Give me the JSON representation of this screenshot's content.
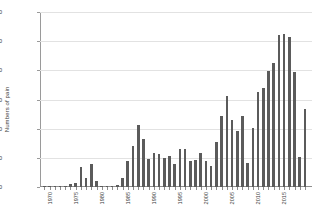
{
  "chart_data": {
    "type": "bar",
    "title": "",
    "xlabel": "",
    "ylabel": "Numbers of pain",
    "ylim": [
      0,
      3000
    ],
    "ytick_values": [
      0,
      500,
      1000,
      1500,
      2000,
      2500,
      3000
    ],
    "ytick_labels": [
      "0",
      "500",
      "1000",
      "1500",
      "2000",
      "2500",
      "3000"
    ],
    "xtick_labels": [
      "1970",
      "1975",
      "1980",
      "1985",
      "1990",
      "1995",
      "2000",
      "2005",
      "2010",
      "2015"
    ],
    "xlim": [
      1970,
      2018
    ],
    "grid": "horizontal",
    "legend": "none",
    "bar_color": "#5b5b5b",
    "categories": [
      "1970",
      "1971",
      "1972",
      "1973",
      "1974",
      "1975",
      "1976",
      "1977",
      "1978",
      "1979",
      "1980",
      "1981",
      "1982",
      "1983",
      "1984",
      "1985",
      "1986",
      "1987",
      "1988",
      "1989",
      "1990",
      "1991",
      "1992",
      "1993",
      "1994",
      "1995",
      "1996",
      "1997",
      "1998",
      "1999",
      "2000",
      "2001",
      "2002",
      "2003",
      "2004",
      "2005",
      "2006",
      "2007",
      "2008",
      "2009",
      "2010",
      "2011",
      "2012",
      "2013",
      "2014",
      "2015",
      "2016",
      "2017",
      "2018"
    ],
    "values": [
      5,
      4,
      6,
      5,
      8,
      60,
      75,
      335,
      160,
      400,
      95,
      8,
      6,
      7,
      40,
      150,
      450,
      700,
      1065,
      830,
      485,
      590,
      560,
      505,
      535,
      400,
      645,
      645,
      450,
      465,
      590,
      450,
      355,
      775,
      1220,
      1555,
      1145,
      960,
      1210,
      405,
      1010,
      1635,
      1690,
      1995,
      2130,
      2600,
      2615,
      2580,
      1965
    ],
    "extra_values": [
      510,
      1345
    ]
  }
}
